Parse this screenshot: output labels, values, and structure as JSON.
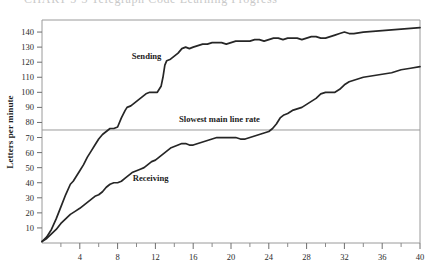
{
  "figure": {
    "cut_top_text": "CHART  5-3   Telegraph Code Learning Progress",
    "background_color": "#ffffff",
    "ink_color": "#262626",
    "axis_color": "#8a8a8a"
  },
  "chart_data": {
    "type": "line",
    "title": "",
    "xlabel": "",
    "ylabel": "Letters per minute",
    "xlim": [
      0,
      40
    ],
    "ylim": [
      0,
      148
    ],
    "grid": false,
    "legend": "inline-labels",
    "y_ticks": [
      10,
      20,
      30,
      40,
      50,
      60,
      70,
      80,
      90,
      100,
      110,
      120,
      130,
      140
    ],
    "x_ticks": [
      4,
      8,
      12,
      16,
      20,
      24,
      28,
      32,
      36,
      40
    ],
    "x_minor_ticks": [
      2,
      6,
      10,
      14,
      18,
      22,
      26,
      30,
      34,
      38
    ],
    "annotations": [
      {
        "text": "Sending",
        "x": 9.5,
        "y": 122,
        "name": "sending-label"
      },
      {
        "text": "Receiving",
        "x": 9.6,
        "y": 41,
        "name": "receiving-label"
      },
      {
        "text": "Slowest main line rate",
        "x": 14.5,
        "y": 80,
        "name": "reference-line-label"
      }
    ],
    "reference_lines": [
      {
        "name": "slowest-main-line-rate",
        "orientation": "horizontal",
        "value": 75,
        "color": "#9a9a9a"
      }
    ],
    "series": [
      {
        "name": "Sending",
        "color": "#262626",
        "x": [
          0.0,
          0.5,
          1.0,
          1.5,
          2.0,
          2.5,
          3.0,
          3.3,
          3.6,
          4.0,
          4.4,
          4.8,
          5.2,
          5.6,
          6.0,
          6.4,
          6.8,
          7.0,
          7.2,
          7.6,
          8.0,
          8.4,
          8.8,
          9.0,
          9.4,
          9.8,
          10.2,
          10.6,
          11.0,
          11.4,
          11.8,
          12.2,
          12.6,
          12.8,
          13.0,
          13.2,
          13.6,
          14.0,
          14.4,
          14.8,
          15.2,
          15.6,
          16.0,
          16.5,
          17.0,
          17.5,
          18.0,
          18.5,
          19.0,
          19.5,
          20.0,
          20.5,
          21.0,
          21.5,
          22.0,
          22.5,
          23.0,
          23.5,
          24.0,
          24.5,
          25.0,
          25.5,
          26.0,
          26.5,
          27.0,
          27.5,
          28.0,
          28.5,
          29.0,
          29.5,
          30.0,
          30.5,
          31.0,
          31.5,
          32.0,
          32.5,
          33.0,
          34.0,
          36.0,
          38.0,
          40.0
        ],
        "y": [
          1,
          4,
          9,
          16,
          24,
          32,
          39,
          41,
          44,
          48,
          52,
          57,
          61,
          65,
          69,
          72,
          74,
          75,
          76,
          76,
          77,
          83,
          88,
          90,
          91,
          93,
          95,
          97,
          99,
          100,
          100,
          100,
          104,
          110,
          118,
          121,
          122,
          124,
          126,
          129,
          130,
          129,
          130,
          131,
          132,
          132,
          133,
          133,
          133,
          132,
          133,
          134,
          134,
          134,
          134,
          135,
          135,
          134,
          135,
          136,
          136,
          135,
          136,
          136,
          136,
          135,
          136,
          137,
          137,
          136,
          136,
          137,
          138,
          139,
          140,
          139,
          139,
          140,
          141,
          142,
          143
        ]
      },
      {
        "name": "Receiving",
        "color": "#262626",
        "x": [
          0.0,
          0.5,
          1.0,
          1.5,
          2.0,
          2.5,
          3.0,
          3.5,
          4.0,
          4.4,
          4.8,
          5.2,
          5.6,
          6.0,
          6.4,
          6.8,
          7.2,
          7.6,
          8.0,
          8.4,
          8.8,
          9.2,
          9.6,
          10.0,
          10.4,
          10.8,
          11.2,
          11.6,
          12.0,
          12.4,
          12.8,
          13.2,
          13.6,
          14.0,
          14.4,
          14.8,
          15.2,
          15.6,
          16.0,
          16.5,
          17.0,
          17.5,
          18.0,
          18.5,
          19.0,
          19.5,
          20.0,
          20.5,
          21.0,
          21.5,
          22.0,
          22.5,
          23.0,
          23.5,
          24.0,
          24.4,
          24.8,
          25.2,
          25.6,
          26.0,
          26.5,
          27.0,
          27.5,
          28.0,
          28.5,
          29.0,
          29.5,
          30.0,
          30.5,
          31.0,
          31.5,
          32.0,
          32.5,
          33.0,
          33.5,
          34.0,
          35.0,
          36.0,
          37.0,
          38.0,
          39.0,
          40.0
        ],
        "y": [
          1,
          3,
          6,
          9,
          13,
          16,
          19,
          21,
          23,
          25,
          27,
          29,
          31,
          32,
          34,
          37,
          39,
          40,
          40,
          41,
          43,
          45,
          47,
          48,
          49,
          50,
          52,
          54,
          55,
          57,
          59,
          61,
          63,
          64,
          65,
          66,
          66,
          65,
          65,
          66,
          67,
          68,
          69,
          70,
          70,
          70,
          70,
          70,
          69,
          69,
          70,
          71,
          72,
          73,
          74,
          76,
          79,
          83,
          85,
          86,
          88,
          89,
          90,
          92,
          94,
          96,
          99,
          100,
          100,
          100,
          102,
          105,
          107,
          108,
          109,
          110,
          111,
          112,
          113,
          115,
          116,
          117
        ]
      }
    ]
  }
}
